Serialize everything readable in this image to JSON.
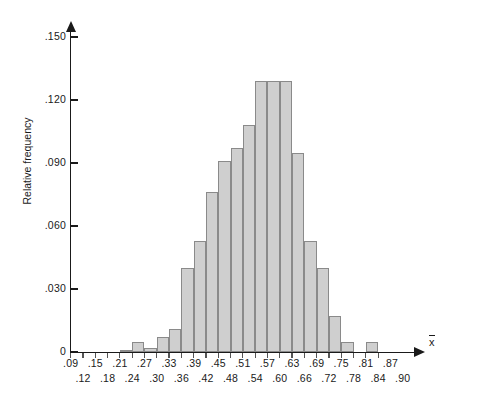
{
  "chart_data": {
    "type": "bar",
    "title": "",
    "subtitle": "",
    "xlabel": "x̄",
    "ylabel": "Relative frequency",
    "grid": false,
    "legend": "none",
    "xlim": [
      0.09,
      0.93
    ],
    "ylim": [
      0,
      0.15
    ],
    "bin_width": 0.03,
    "y_ticks": [
      {
        "value": 0.15,
        "label": ".150"
      },
      {
        "value": 0.12,
        "label": ".120"
      },
      {
        "value": 0.09,
        "label": ".090"
      },
      {
        "value": 0.06,
        "label": ".060"
      },
      {
        "value": 0.03,
        "label": ".030"
      },
      {
        "value": 0.0,
        "label": "0"
      }
    ],
    "x_ticks_upper": [
      ".09",
      ".15",
      ".21",
      ".27",
      ".33",
      ".39",
      ".45",
      ".51",
      ".57",
      ".63",
      ".69",
      ".75",
      ".81",
      ".87"
    ],
    "x_ticks_lower": [
      ".12",
      ".18",
      ".24",
      ".30",
      ".36",
      ".42",
      ".48",
      ".54",
      ".60",
      ".66",
      ".72",
      ".78",
      ".84",
      ".90"
    ],
    "x_tick_values_upper": [
      0.09,
      0.15,
      0.21,
      0.27,
      0.33,
      0.39,
      0.45,
      0.51,
      0.57,
      0.63,
      0.69,
      0.75,
      0.81,
      0.87
    ],
    "x_tick_values_lower": [
      0.12,
      0.18,
      0.24,
      0.3,
      0.36,
      0.42,
      0.48,
      0.54,
      0.6,
      0.66,
      0.72,
      0.78,
      0.84,
      0.9
    ],
    "bin_edges": [
      0.09,
      0.12,
      0.15,
      0.18,
      0.21,
      0.24,
      0.27,
      0.3,
      0.33,
      0.36,
      0.39,
      0.42,
      0.45,
      0.48,
      0.51,
      0.54,
      0.57,
      0.6,
      0.63,
      0.66,
      0.69,
      0.72,
      0.75,
      0.78,
      0.81,
      0.84
    ],
    "categories": [
      ".09-.12",
      ".12-.15",
      ".15-.18",
      ".18-.21",
      ".21-.24",
      ".24-.27",
      ".27-.30",
      ".30-.33",
      ".33-.36",
      ".36-.39",
      ".39-.42",
      ".42-.45",
      ".45-.48",
      ".48-.51",
      ".51-.54",
      ".54-.57",
      ".57-.60",
      ".60-.63",
      ".63-.66",
      ".66-.69",
      ".69-.72",
      ".72-.75",
      ".75-.78",
      ".78-.81",
      ".81-.84"
    ],
    "values": [
      0.0,
      0.0,
      0.0,
      0.0,
      0.001,
      0.005,
      0.002,
      0.007,
      0.011,
      0.04,
      0.053,
      0.076,
      0.091,
      0.097,
      0.108,
      0.129,
      0.129,
      0.129,
      0.095,
      0.053,
      0.04,
      0.017,
      0.005,
      0.0,
      0.005
    ],
    "bar_fill_color": "#cfcfcf",
    "bar_edge_color": "#8a8a8a",
    "axis_color": "#1a1a1a"
  }
}
